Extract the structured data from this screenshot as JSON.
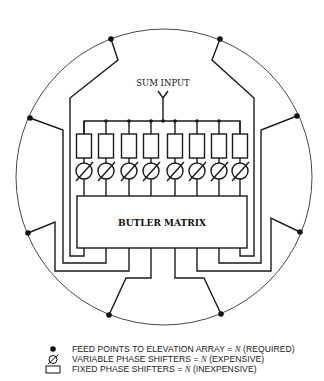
{
  "diagram": {
    "sum_input_label": "SUM INPUT",
    "matrix_label": "BUTLER MATRIX",
    "num_channels": 8,
    "num_feed_points": 8,
    "colors": {
      "line": "#1a1a1a",
      "background": "#ffffff"
    }
  },
  "legend": {
    "items": [
      {
        "icon": "filled-dot-icon",
        "text": "FEED POINTS TO ELEVATION ARRAY = ",
        "var": "N",
        "suffix": " (REQUIRED)"
      },
      {
        "icon": "variable-phase-shifter-icon",
        "text": "VARIABLE PHASE SHIFTERS = ",
        "var": "N",
        "suffix": " (EXPENSIVE)"
      },
      {
        "icon": "fixed-phase-shifter-icon",
        "text": "FIXED PHASE SHIFTERS = ",
        "var": "N",
        "suffix": " (INEXPENSIVE)"
      }
    ]
  }
}
